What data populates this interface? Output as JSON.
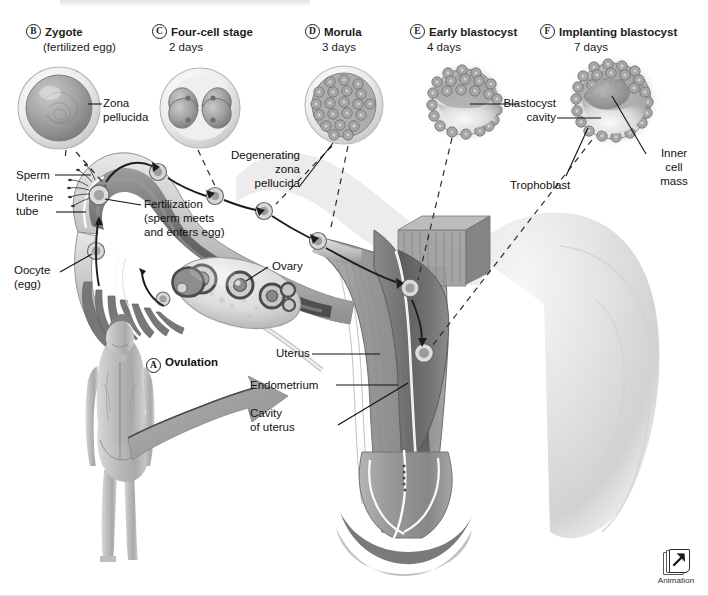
{
  "figure": {
    "background": "#ffffff"
  },
  "stages": [
    {
      "letter": "B",
      "name": "Zygote",
      "sub": "(fertilized egg)"
    },
    {
      "letter": "C",
      "name": "Four-cell stage",
      "sub": "2 days"
    },
    {
      "letter": "D",
      "name": "Morula",
      "sub": "3 days"
    },
    {
      "letter": "E",
      "name": "Early blastocyst",
      "sub": "4 days"
    },
    {
      "letter": "F",
      "name": "Implanting blastocyst",
      "sub": "7 days"
    }
  ],
  "labels": {
    "zona_pellucida": "Zona\npellucida",
    "blastocyst_cavity": "Blastocyst\ncavity",
    "inner_cell_mass": "Inner\ncell\nmass",
    "trophoblast": "Trophoblast",
    "degenerating_zona": "Degenerating\nzona\npellucida",
    "sperm": "Sperm",
    "uterine_tube": "Uterine\ntube",
    "oocyte": "Oocyte\n(egg)",
    "fertilization": "Fertilization\n(sperm meets\nand enters egg)",
    "ovary": "Ovary",
    "ovulation": "Ovulation",
    "ovulation_letter": "A",
    "uterus": "Uterus",
    "endometrium": "Endometrium",
    "cavity_of_uterus": "Cavity\nof uterus"
  },
  "animation_button": {
    "caption": "Animation",
    "icon": "launch-window-arrow-icon"
  },
  "colors": {
    "text": "#111111",
    "line": "#1a1a1a",
    "tube_wall": "#6f6f6f",
    "tube_dark": "#4e4e4e",
    "uterus_muscle": "#8d8d8d",
    "endometrium": "#6a6a6a",
    "cell_fill": "#9a9a9a",
    "zona": "#dedede"
  }
}
